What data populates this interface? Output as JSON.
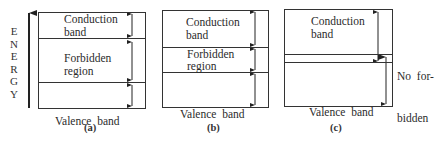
{
  "axis": {
    "label": "ENERGY",
    "letters": [
      "E",
      "N",
      "E",
      "R",
      "G",
      "Y"
    ]
  },
  "panels": [
    {
      "caption": "(a)",
      "description": "Insulator - wide forbidden region",
      "bands": [
        {
          "name": "conduction",
          "line1": "Conduction",
          "line2": "band"
        },
        {
          "name": "forbidden",
          "line1": "Forbidden",
          "line2": "region"
        },
        {
          "name": "valence",
          "line1": "Valence  band"
        }
      ]
    },
    {
      "caption": "(b)",
      "description": "Semiconductor - narrow forbidden region",
      "bands": [
        {
          "name": "conduction",
          "line1": "Conduction",
          "line2": "band"
        },
        {
          "name": "forbidden",
          "line1": "Forbidden",
          "line2": "region"
        },
        {
          "name": "valence",
          "line1": "Valence  band"
        }
      ]
    },
    {
      "caption": "(c)",
      "description": "Conductor - overlapping bands",
      "bands": [
        {
          "name": "conduction",
          "line1": "Conduction",
          "line2": "band"
        },
        {
          "name": "valence",
          "line1": "Valence  band"
        }
      ],
      "annotation": {
        "line1": "No  for-",
        "line2": "bidden",
        "line3": "region"
      }
    }
  ],
  "colors": {
    "line": "#333333",
    "background": "#ffffff",
    "text": "#2b2b2b"
  }
}
